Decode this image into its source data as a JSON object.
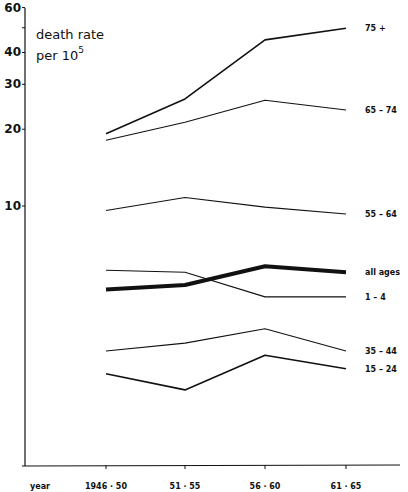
{
  "chart_data": {
    "type": "line",
    "ylabel_line1": "death rate",
    "ylabel_line2_base": "per 10",
    "ylabel_line2_exp": "5",
    "xlabel": "year",
    "yscale": "log",
    "ylim": [
      1,
      63
    ],
    "yticks": [
      10,
      20,
      30,
      40,
      50,
      60
    ],
    "ytick_labels": [
      "10",
      "20",
      "30",
      "40",
      "",
      "60"
    ],
    "grid": false,
    "legend_position": "inline-right",
    "categories": [
      "1946-50",
      "51-55",
      "56-60",
      "61-65"
    ],
    "series": [
      {
        "name": "75 +",
        "label": "75 +",
        "values": [
          19.2,
          26.3,
          44.8,
          49.8
        ],
        "stroke_width": 1.6
      },
      {
        "name": "65-74",
        "label": "65 – 74",
        "values": [
          18.1,
          21.3,
          26.0,
          23.8
        ],
        "stroke_width": 1.1
      },
      {
        "name": "55-64",
        "label": "55 – 64",
        "values": [
          9.6,
          10.8,
          9.9,
          9.3
        ],
        "stroke_width": 1.1
      },
      {
        "name": "all ages",
        "label": "all ages",
        "values": [
          4.7,
          4.9,
          5.8,
          5.5
        ],
        "stroke_width": 4
      },
      {
        "name": "1-4",
        "label": "1 – 4",
        "values": [
          5.6,
          5.5,
          4.4,
          4.4
        ],
        "stroke_width": 1.1
      },
      {
        "name": "35-44",
        "label": "35 – 44",
        "values": [
          2.7,
          2.9,
          3.3,
          2.7
        ],
        "stroke_width": 1.1
      },
      {
        "name": "15-24",
        "label": "15 – 24",
        "values": [
          2.2,
          1.9,
          2.6,
          2.3
        ],
        "stroke_width": 1.6
      }
    ]
  },
  "layout": {
    "axis_x": 25,
    "baseline_y": 466,
    "y_ref_value": 10,
    "y_ref_px": 206,
    "px_per_decade": 255,
    "x_positions": [
      106,
      185,
      265,
      346
    ],
    "x_axis_end": 400,
    "y_axis_top": 8,
    "label_x": 365,
    "line_color": "#111111"
  }
}
